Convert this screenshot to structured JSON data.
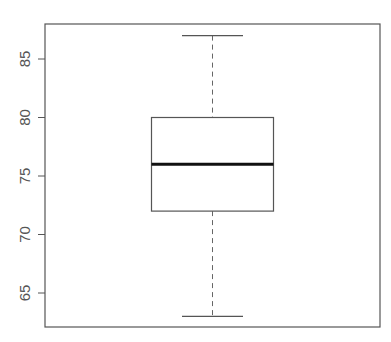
{
  "chart_data": {
    "type": "boxplot",
    "title": "",
    "xlabel": "",
    "ylabel": "",
    "ylim": [
      62,
      88
    ],
    "yticks": [
      65,
      70,
      75,
      80,
      85
    ],
    "ytick_labels": [
      "65",
      "70",
      "75",
      "80",
      "85"
    ],
    "grid": false,
    "boxes": [
      {
        "name": "",
        "min": 63,
        "q1": 72,
        "median": 76,
        "q3": 80,
        "max": 87
      }
    ]
  }
}
